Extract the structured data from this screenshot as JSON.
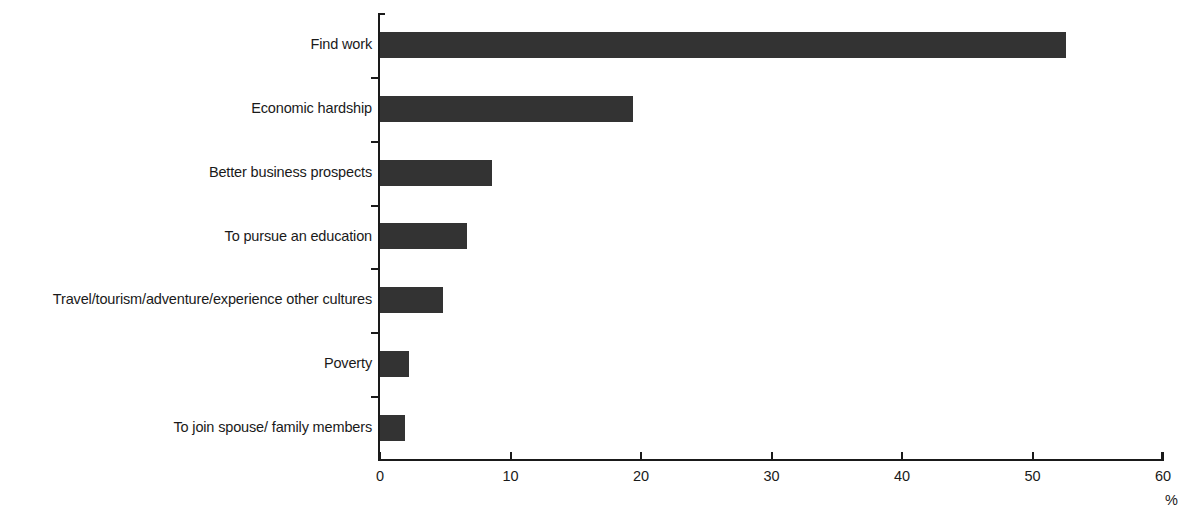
{
  "chart_data": {
    "type": "bar",
    "orientation": "horizontal",
    "title": "",
    "subtitle": "",
    "xlabel": "%",
    "ylabel": "",
    "categories": [
      "Find work",
      "Economic hardship",
      "Better business prospects",
      "To pursue an education",
      "Travel/tourism/adventure/experience other cultures",
      "Poverty",
      "To join spouse/ family members"
    ],
    "values": [
      52.6,
      19.4,
      8.6,
      6.7,
      4.8,
      2.2,
      1.9
    ],
    "xlim": [
      0,
      60
    ],
    "xticks": [
      0,
      10,
      20,
      30,
      40,
      50,
      60
    ],
    "xtick_labels": [
      "0",
      "10",
      "20",
      "30",
      "40",
      "50",
      "60"
    ],
    "grid": false,
    "legend": null,
    "bar_color": "#333333",
    "background_color": "#ffffff",
    "axis_color": "#1a1a1a"
  },
  "axis": {
    "unit_label": "%"
  }
}
